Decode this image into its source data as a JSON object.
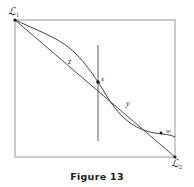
{
  "figure": {
    "caption": "Figure 13",
    "frame": {
      "x0": 15,
      "y0": 20,
      "x1": 175,
      "y1": 157,
      "stroke": "#9a9a9a",
      "stroke_width": 1
    },
    "endpoints": {
      "upper_left": {
        "label": "ℒ",
        "subscript": "1",
        "x": 15,
        "y": 20
      },
      "lower_right": {
        "label": "ℒ",
        "subscript": "2",
        "x": 175,
        "y": 157
      }
    },
    "vertical_line": {
      "x": 98,
      "y_top": 45,
      "y_bottom": 141,
      "stroke": "#4a4a4a"
    },
    "diagonal_line": {
      "from_x": 15,
      "from_y": 20,
      "to_x": 175,
      "to_y": 157,
      "stroke": "#3a3a3a"
    },
    "curve": {
      "description": "S-shaped curve from upper-left corner through center point x to the right, rejoining the diagonal at w",
      "stroke": "#2a2a2a",
      "path": "M15,20 C46,34 62,40 75,53 C87,65 91,72 98,82 C105,92 110,104 122,116 C134,128 148,133 163,134 C168,134.4 172,135.6 175,137"
    },
    "points": [
      {
        "name": "x",
        "label": "x",
        "x": 98,
        "y": 82,
        "dot": true
      },
      {
        "name": "w",
        "label": "w",
        "x": 161,
        "y": 133,
        "dot": true
      }
    ],
    "labels": [
      {
        "name": "z",
        "label": "z",
        "x": 68,
        "y": 58
      },
      {
        "name": "x",
        "label": "x",
        "x": 101,
        "y": 76
      },
      {
        "name": "y",
        "label": "y",
        "x": 126,
        "y": 100
      },
      {
        "name": "w",
        "label": "w",
        "x": 166,
        "y": 128
      }
    ],
    "colors": {
      "frame": "#9a9a9a",
      "curve": "#2a2a2a",
      "line": "#3a3a3a",
      "text": "#2a2a2a",
      "caption": "#1a1a1a",
      "background": "#ffffff"
    }
  }
}
